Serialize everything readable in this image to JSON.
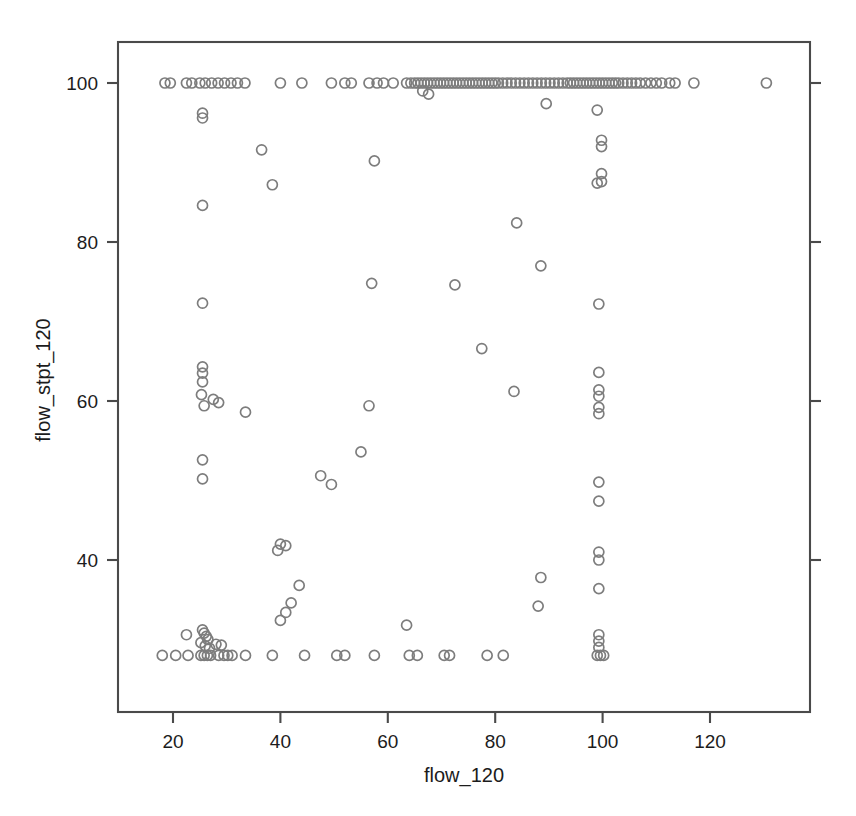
{
  "chart_data": {
    "type": "scatter",
    "title": "",
    "subtitle": "",
    "xlabel": "flow_120",
    "ylabel": "flow_stpt_120",
    "xlim": [
      11,
      140
    ],
    "ylim": [
      22.5,
      104
    ],
    "xticks": [
      20,
      40,
      60,
      80,
      100,
      120
    ],
    "xtick_labels": [
      "20",
      "40",
      "60",
      "80",
      "100",
      "120"
    ],
    "yticks": [
      40,
      60,
      80,
      100
    ],
    "ytick_labels": [
      "40",
      "60",
      "80",
      "100"
    ],
    "grid": false,
    "legend": null,
    "marker": "open-circle",
    "marker_color": "#7d7d7d",
    "marker_radius_px": 5,
    "frame_color": "#4a4a4a",
    "background_color": "#ffffff",
    "series": [
      {
        "name": "flow_stpt_120 vs flow_120",
        "points": [
          [
            18.5,
            100
          ],
          [
            19.5,
            100
          ],
          [
            22.5,
            100
          ],
          [
            23.5,
            100
          ],
          [
            25.0,
            100
          ],
          [
            26.0,
            100
          ],
          [
            27.2,
            100
          ],
          [
            28.4,
            100
          ],
          [
            29.6,
            100
          ],
          [
            30.8,
            100
          ],
          [
            32.0,
            100
          ],
          [
            33.4,
            100
          ],
          [
            40.0,
            100
          ],
          [
            44.0,
            100
          ],
          [
            49.5,
            100
          ],
          [
            52.0,
            100
          ],
          [
            53.2,
            100
          ],
          [
            56.5,
            100
          ],
          [
            58.0,
            100
          ],
          [
            59.2,
            100
          ],
          [
            61.0,
            100
          ],
          [
            63.5,
            100
          ],
          [
            64.3,
            100
          ],
          [
            65.0,
            100
          ],
          [
            65.6,
            100
          ],
          [
            66.2,
            100
          ],
          [
            66.8,
            100
          ],
          [
            67.4,
            100
          ],
          [
            68.0,
            100
          ],
          [
            68.6,
            100
          ],
          [
            69.2,
            100
          ],
          [
            69.8,
            100
          ],
          [
            70.4,
            100
          ],
          [
            71.0,
            100
          ],
          [
            71.6,
            100
          ],
          [
            72.2,
            100
          ],
          [
            72.8,
            100
          ],
          [
            73.4,
            100
          ],
          [
            74.0,
            100
          ],
          [
            74.6,
            100
          ],
          [
            75.2,
            100
          ],
          [
            75.8,
            100
          ],
          [
            76.4,
            100
          ],
          [
            77.0,
            100
          ],
          [
            77.6,
            100
          ],
          [
            78.2,
            100
          ],
          [
            78.8,
            100
          ],
          [
            79.4,
            100
          ],
          [
            80.0,
            100
          ],
          [
            80.6,
            100
          ],
          [
            81.4,
            100
          ],
          [
            82.2,
            100
          ],
          [
            83.0,
            100
          ],
          [
            83.8,
            100
          ],
          [
            84.6,
            100
          ],
          [
            85.4,
            100
          ],
          [
            86.2,
            100
          ],
          [
            87.0,
            100
          ],
          [
            87.8,
            100
          ],
          [
            88.6,
            100
          ],
          [
            89.4,
            100
          ],
          [
            90.2,
            100
          ],
          [
            91.0,
            100
          ],
          [
            91.8,
            100
          ],
          [
            92.6,
            100
          ],
          [
            93.4,
            100
          ],
          [
            94.0,
            100
          ],
          [
            94.6,
            100
          ],
          [
            95.2,
            100
          ],
          [
            95.8,
            100
          ],
          [
            96.4,
            100
          ],
          [
            97.0,
            100
          ],
          [
            97.6,
            100
          ],
          [
            98.2,
            100
          ],
          [
            98.8,
            100
          ],
          [
            99.4,
            100
          ],
          [
            100.0,
            100
          ],
          [
            100.6,
            100
          ],
          [
            101.2,
            100
          ],
          [
            101.8,
            100
          ],
          [
            102.4,
            100
          ],
          [
            103.0,
            100
          ],
          [
            103.8,
            100
          ],
          [
            104.6,
            100
          ],
          [
            105.4,
            100
          ],
          [
            106.2,
            100
          ],
          [
            107.0,
            100
          ],
          [
            108.0,
            100
          ],
          [
            109.0,
            100
          ],
          [
            110.0,
            100
          ],
          [
            111.0,
            100
          ],
          [
            112.5,
            100
          ],
          [
            113.5,
            100
          ],
          [
            117.0,
            100
          ],
          [
            130.5,
            100
          ],
          [
            66.5,
            99.0
          ],
          [
            67.6,
            98.6
          ],
          [
            89.5,
            97.4
          ],
          [
            99.0,
            96.6
          ],
          [
            25.5,
            96.2
          ],
          [
            25.5,
            95.6
          ],
          [
            99.8,
            92.8
          ],
          [
            99.8,
            92.0
          ],
          [
            36.5,
            91.6
          ],
          [
            57.5,
            90.2
          ],
          [
            99.8,
            88.6
          ],
          [
            99.8,
            87.6
          ],
          [
            99.0,
            87.4
          ],
          [
            38.5,
            87.2
          ],
          [
            25.5,
            84.6
          ],
          [
            84.0,
            82.4
          ],
          [
            25.5,
            72.3
          ],
          [
            99.3,
            72.2
          ],
          [
            88.5,
            77.0
          ],
          [
            57.0,
            74.8
          ],
          [
            72.5,
            74.6
          ],
          [
            77.5,
            66.6
          ],
          [
            25.5,
            64.3
          ],
          [
            25.5,
            63.5
          ],
          [
            25.5,
            62.4
          ],
          [
            99.3,
            63.6
          ],
          [
            99.3,
            61.4
          ],
          [
            99.3,
            60.6
          ],
          [
            99.3,
            59.2
          ],
          [
            99.3,
            58.4
          ],
          [
            83.5,
            61.2
          ],
          [
            25.3,
            60.8
          ],
          [
            27.5,
            60.2
          ],
          [
            25.8,
            59.4
          ],
          [
            28.5,
            59.8
          ],
          [
            33.5,
            58.6
          ],
          [
            56.5,
            59.4
          ],
          [
            55.0,
            53.6
          ],
          [
            99.3,
            49.8
          ],
          [
            99.3,
            47.4
          ],
          [
            47.5,
            50.6
          ],
          [
            49.5,
            49.5
          ],
          [
            25.5,
            52.6
          ],
          [
            25.5,
            50.2
          ],
          [
            99.3,
            41.0
          ],
          [
            99.3,
            40.0
          ],
          [
            40.0,
            42.0
          ],
          [
            41.0,
            41.8
          ],
          [
            39.5,
            41.2
          ],
          [
            99.3,
            36.4
          ],
          [
            88.5,
            37.8
          ],
          [
            43.5,
            36.8
          ],
          [
            42.0,
            34.6
          ],
          [
            88.0,
            34.2
          ],
          [
            41.0,
            33.4
          ],
          [
            40.0,
            32.4
          ],
          [
            63.5,
            31.8
          ],
          [
            25.5,
            31.2
          ],
          [
            25.8,
            30.8
          ],
          [
            26.2,
            30.4
          ],
          [
            22.5,
            30.6
          ],
          [
            26.5,
            30.0
          ],
          [
            25.2,
            29.6
          ],
          [
            26.0,
            29.2
          ],
          [
            28.0,
            29.4
          ],
          [
            29.0,
            29.3
          ],
          [
            26.8,
            28.9
          ],
          [
            99.3,
            30.6
          ],
          [
            99.3,
            29.8
          ],
          [
            99.3,
            29.0
          ],
          [
            18.0,
            28.0
          ],
          [
            20.5,
            28.0
          ],
          [
            22.8,
            28.0
          ],
          [
            25.2,
            28.0
          ],
          [
            25.8,
            28.0
          ],
          [
            26.4,
            28.0
          ],
          [
            27.0,
            28.0
          ],
          [
            28.5,
            28.0
          ],
          [
            29.5,
            28.0
          ],
          [
            30.2,
            28.0
          ],
          [
            31.0,
            28.0
          ],
          [
            33.5,
            28.0
          ],
          [
            38.5,
            28.0
          ],
          [
            44.5,
            28.0
          ],
          [
            50.5,
            28.0
          ],
          [
            52.0,
            28.0
          ],
          [
            57.5,
            28.0
          ],
          [
            64.0,
            28.0
          ],
          [
            65.5,
            28.0
          ],
          [
            70.5,
            28.0
          ],
          [
            71.5,
            28.0
          ],
          [
            78.5,
            28.0
          ],
          [
            81.5,
            28.0
          ],
          [
            99.0,
            28.0
          ],
          [
            99.6,
            28.0
          ],
          [
            100.2,
            28.0
          ]
        ]
      }
    ]
  },
  "axes": {
    "x_title": "flow_120",
    "y_title": "flow_stpt_120"
  }
}
